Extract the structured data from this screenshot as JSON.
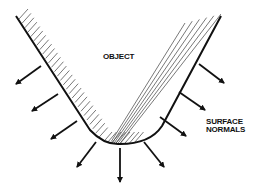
{
  "diagram": {
    "labels": {
      "object": "OBJECT",
      "surface_line1": "SURFACE",
      "surface_line2": "NORMALS"
    },
    "colors": {
      "stroke": "#111111",
      "hatch": "#555555",
      "background": "#ffffff"
    },
    "outline_path": "M16 16 L90 130 Q104 145 120 144 Q150 144 162 126 L221 16",
    "normals": [
      {
        "x1": 41,
        "y1": 66,
        "x2": 16,
        "y2": 84
      },
      {
        "x1": 58,
        "y1": 94,
        "x2": 32,
        "y2": 111
      },
      {
        "x1": 77,
        "y1": 121,
        "x2": 51,
        "y2": 139
      },
      {
        "x1": 96,
        "y1": 142,
        "x2": 77,
        "y2": 167
      },
      {
        "x1": 120,
        "y1": 148,
        "x2": 120,
        "y2": 182
      },
      {
        "x1": 144,
        "y1": 142,
        "x2": 164,
        "y2": 167
      },
      {
        "x1": 160,
        "y1": 117,
        "x2": 186,
        "y2": 136
      },
      {
        "x1": 179,
        "y1": 92,
        "x2": 205,
        "y2": 110
      },
      {
        "x1": 199,
        "y1": 64,
        "x2": 224,
        "y2": 83
      }
    ]
  }
}
